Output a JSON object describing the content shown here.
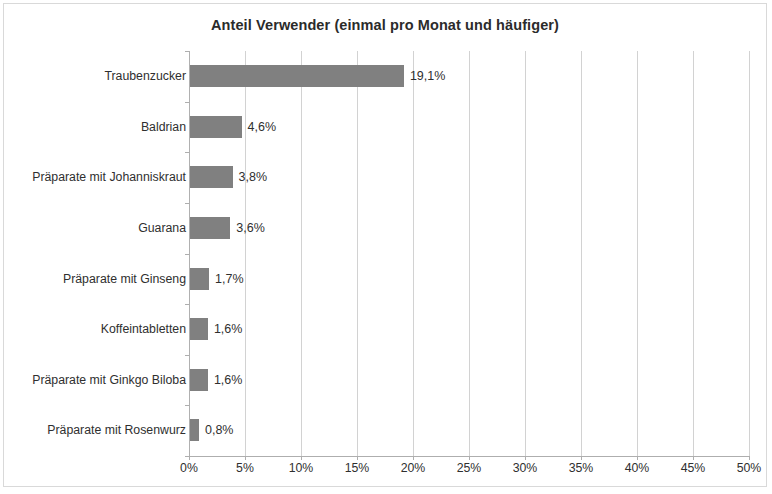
{
  "chart_data": {
    "type": "bar",
    "orientation": "horizontal",
    "title": "Anteil Verwender (einmal pro Monat und häufiger)",
    "xlabel": "",
    "ylabel": "",
    "xlim": [
      0,
      50
    ],
    "xtick_values": [
      0,
      5,
      10,
      15,
      20,
      25,
      30,
      35,
      40,
      45,
      50
    ],
    "xtick_labels": [
      "0%",
      "5%",
      "10%",
      "15%",
      "20%",
      "25%",
      "30%",
      "35%",
      "40%",
      "45%",
      "50%"
    ],
    "grid": "vertical",
    "legend": null,
    "bar_color": "#808080",
    "categories": [
      "Traubenzucker",
      "Baldrian",
      "Präparate mit Johanniskraut",
      "Guarana",
      "Präparate mit Ginseng",
      "Koffeintabletten",
      "Präparate mit Ginkgo Biloba",
      "Präparate mit Rosenwurz"
    ],
    "values": [
      19.1,
      4.6,
      3.8,
      3.6,
      1.7,
      1.6,
      1.6,
      0.8
    ],
    "value_labels": [
      "19,1%",
      "4,6%",
      "3,8%",
      "3,6%",
      "1,7%",
      "1,6%",
      "1,6%",
      "0,8%"
    ]
  }
}
